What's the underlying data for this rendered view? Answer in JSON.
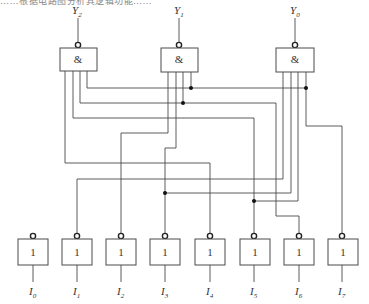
{
  "header": {
    "cropped_text": "……根据电路图分析其逻辑功能……"
  },
  "outputs": [
    {
      "name": "Y",
      "sub": "2",
      "gate_symbol": "&"
    },
    {
      "name": "Y",
      "sub": "1",
      "gate_symbol": "&"
    },
    {
      "name": "Y",
      "sub": "0",
      "gate_symbol": "&"
    }
  ],
  "inputs": [
    {
      "name": "I",
      "sub": "0",
      "gate_symbol": "1"
    },
    {
      "name": "I",
      "sub": "1",
      "gate_symbol": "1"
    },
    {
      "name": "I",
      "sub": "2",
      "gate_symbol": "1"
    },
    {
      "name": "I",
      "sub": "3",
      "gate_symbol": "1"
    },
    {
      "name": "I",
      "sub": "4",
      "gate_symbol": "1"
    },
    {
      "name": "I",
      "sub": "5",
      "gate_symbol": "1"
    },
    {
      "name": "I",
      "sub": "6",
      "gate_symbol": "1"
    },
    {
      "name": "I",
      "sub": "7",
      "gate_symbol": "1"
    }
  ],
  "connections": {
    "Y2": [
      "I1",
      "I3",
      "I5",
      "I7"
    ],
    "Y1": [
      "I2",
      "I3",
      "I6",
      "I7"
    ],
    "Y0": [
      "I4",
      "I5",
      "I6",
      "I7"
    ]
  },
  "colors": {
    "wire": "#4a4a4a",
    "junction": "#111111",
    "background": "#ffffff"
  }
}
